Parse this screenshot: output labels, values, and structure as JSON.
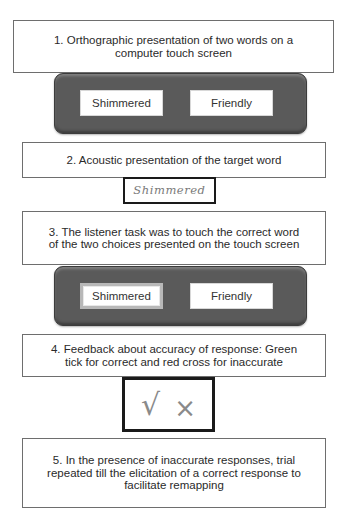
{
  "steps": [
    {
      "text": "1. Orthographic presentation of two words on a computer touch screen"
    },
    {
      "text": "2. Acoustic presentation of the target word"
    },
    {
      "text": "3. The listener task was to touch the correct word of the two choices presented on the touch screen"
    },
    {
      "text": "4. Feedback about accuracy of response: Green tick for correct and red cross for inaccurate"
    },
    {
      "text": "5. In the presence of inaccurate responses, trial repeated till the elicitation of a correct response to facilitate remapping"
    }
  ],
  "screen1": {
    "choices": [
      "Shimmered",
      "Friendly"
    ]
  },
  "audio": {
    "target_word": "Shimmered"
  },
  "screen2": {
    "choices": [
      "Shimmered",
      "Friendly"
    ],
    "selected": "Shimmered"
  },
  "feedback": {
    "tick_symbol": "√",
    "cross_symbol": "×",
    "correct_color": "green",
    "incorrect_color": "red"
  }
}
